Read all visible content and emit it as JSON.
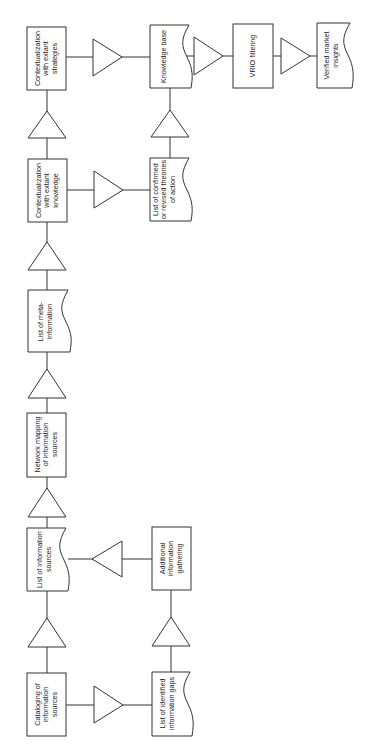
{
  "diagram": {
    "orientation": "rotated-90-ccw",
    "stroke_color": "#333333",
    "background": "#ffffff",
    "nodes": [
      {
        "id": "n1",
        "type": "process",
        "label": "Cataloging of\ninformation\nsources"
      },
      {
        "id": "n2",
        "type": "document",
        "label": "List of information\nsources"
      },
      {
        "id": "n3",
        "type": "process",
        "label": "Network mapping\nof information\nsources"
      },
      {
        "id": "n4",
        "type": "document",
        "label": "List of meta-\ninformation"
      },
      {
        "id": "n5",
        "type": "process",
        "label": "Contextualization\nwith extant\nknowledge"
      },
      {
        "id": "n6",
        "type": "process",
        "label": "Contextualization\nwith extant\nstrategies"
      },
      {
        "id": "n7",
        "type": "document",
        "label": "List of identified\ninformation gaps"
      },
      {
        "id": "n8",
        "type": "process",
        "label": "Additional\ninformation\ngathering"
      },
      {
        "id": "n9",
        "type": "document",
        "label": "List of confirmed\nor revised theories\nof action"
      },
      {
        "id": "n10",
        "type": "document",
        "label": "Knowledge base"
      },
      {
        "id": "n11",
        "type": "process",
        "label": "VRIO filtering"
      },
      {
        "id": "n12",
        "type": "document",
        "label": "Verified market\ninsights"
      }
    ],
    "edges": [
      {
        "from": "n1",
        "to": "n2"
      },
      {
        "from": "n2",
        "to": "n3"
      },
      {
        "from": "n3",
        "to": "n4"
      },
      {
        "from": "n4",
        "to": "n5"
      },
      {
        "from": "n5",
        "to": "n6"
      },
      {
        "from": "n1",
        "to": "n7"
      },
      {
        "from": "n7",
        "to": "n8"
      },
      {
        "from": "n8",
        "to": "n2"
      },
      {
        "from": "n5",
        "to": "n9"
      },
      {
        "from": "n9",
        "to": "n10"
      },
      {
        "from": "n6",
        "to": "n10"
      },
      {
        "from": "n10",
        "to": "n11"
      },
      {
        "from": "n11",
        "to": "n12"
      }
    ]
  }
}
